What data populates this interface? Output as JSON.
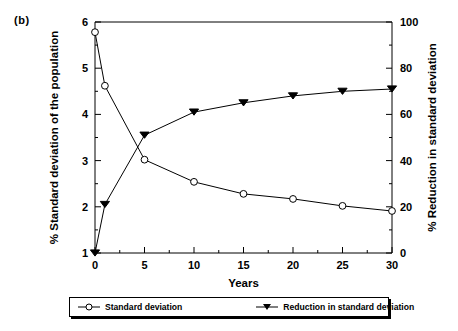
{
  "figure": {
    "panel_label": "(b)"
  },
  "legend": {
    "position": "bottom",
    "entries": [
      {
        "label": "Standard deviation",
        "marker": "open-circle-marker"
      },
      {
        "label": "Reduction in standard deviation",
        "marker": "filled-triangle-down-marker"
      }
    ]
  },
  "chart_data": {
    "type": "line",
    "title": "(b)",
    "xlabel": "Years",
    "ylabel": "% Standard deviation of the population",
    "y2label": "% Reduction in standard deviation",
    "xlim": [
      0,
      30
    ],
    "ylim": [
      1,
      6
    ],
    "y2lim": [
      0,
      100
    ],
    "xticks": [
      0,
      5,
      10,
      15,
      20,
      25,
      30
    ],
    "yticks": [
      1,
      2,
      3,
      4,
      5,
      6
    ],
    "y2ticks": [
      0,
      20,
      40,
      60,
      80,
      100
    ],
    "y2_minor_ticks": [
      10,
      30,
      50,
      70,
      90
    ],
    "y_minor_ticks": [
      1.5,
      2.5,
      3.5,
      4.5,
      5.5
    ],
    "x_minor_ticks": [
      2.5,
      7.5,
      12.5,
      17.5,
      22.5,
      27.5
    ],
    "grid": false,
    "legend_position": "bottom",
    "x": [
      0,
      1,
      5,
      10,
      15,
      20,
      25,
      30
    ],
    "series": [
      {
        "name": "Standard deviation",
        "axis": "left",
        "marker": "open-circle",
        "color": "#000000",
        "values": [
          5.78,
          4.62,
          3.02,
          2.54,
          2.28,
          2.17,
          2.02,
          1.91
        ]
      },
      {
        "name": "Reduction in standard deviation",
        "axis": "right",
        "marker": "filled-triangle-down",
        "color": "#000000",
        "values": [
          0,
          21,
          51,
          61,
          65,
          68,
          70,
          71
        ]
      }
    ]
  }
}
